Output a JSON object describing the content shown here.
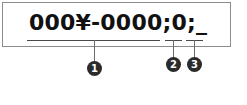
{
  "figure": {
    "code_box": {
      "format_string": "000¥-0000;0;_"
    },
    "segments": [
      {
        "marker_label": "1",
        "text": "000¥-0000"
      },
      {
        "marker_label": "2",
        "text": "0"
      },
      {
        "marker_label": "3",
        "text": "_"
      }
    ]
  }
}
